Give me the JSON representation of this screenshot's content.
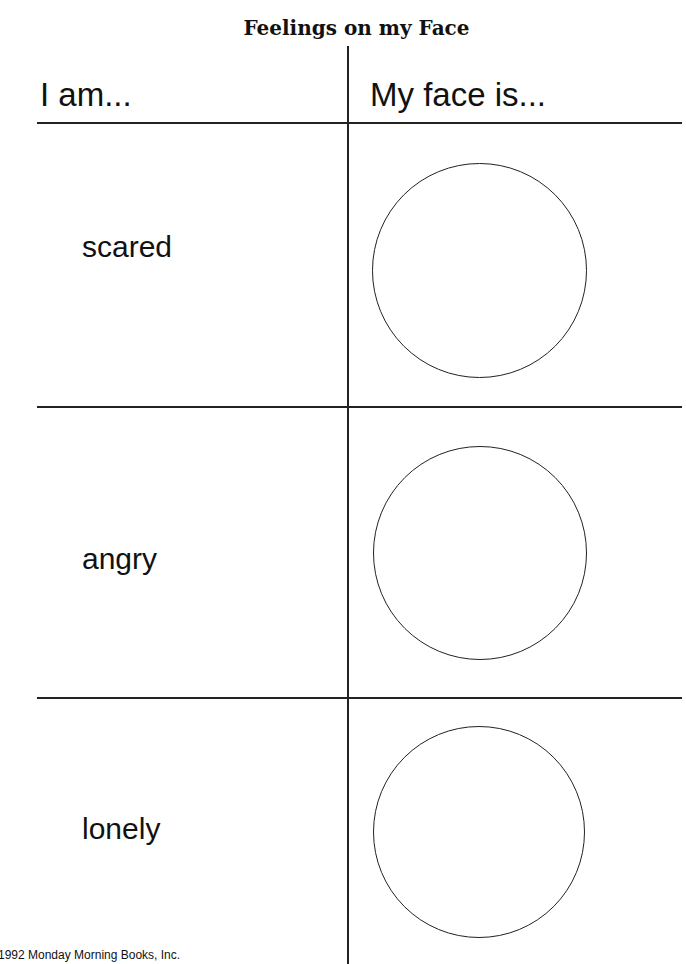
{
  "title": "Feelings on my Face",
  "columns": {
    "left": "I am...",
    "right": "My face is..."
  },
  "rows": [
    {
      "feeling": "scared"
    },
    {
      "feeling": "angry"
    },
    {
      "feeling": "lonely"
    }
  ],
  "footer": "1992 Monday Morning Books, Inc."
}
